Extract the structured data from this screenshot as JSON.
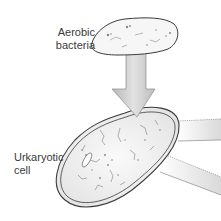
{
  "diagram": {
    "labels": {
      "bacteria_line1": "Aerobic",
      "bacteria_line2": "bacteria",
      "cell_line1": "Urkaryotic",
      "cell_line2": "cell"
    },
    "elements": {
      "bacterium": "aerobic-bacterium-shape",
      "arrow": "down-arrow",
      "cell": "urkaryotic-cell-shape",
      "outgoing_bands": 2
    },
    "colors": {
      "outline": "#3a3a3a",
      "arrow_fill": "#c8c8c8",
      "cell_fill": "#f4f4f4",
      "band_fill": "#e6e6e6"
    }
  }
}
